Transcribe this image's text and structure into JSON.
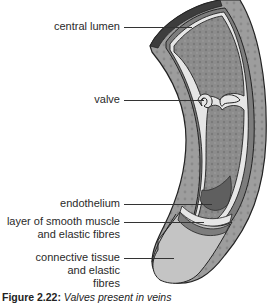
{
  "figure": {
    "labels": [
      {
        "id": "central-lumen",
        "text": "central lumen"
      },
      {
        "id": "valve",
        "text": "valve"
      },
      {
        "id": "endothelium",
        "text": "endothelium"
      },
      {
        "id": "smooth-muscle",
        "line1": "layer of smooth muscle",
        "line2": "and elastic fibres"
      },
      {
        "id": "connective-tissue",
        "line1": "connective tissue",
        "line2": "and elastic",
        "line3": "fibres"
      }
    ],
    "caption": {
      "number": "Figure 2.22:",
      "text": "Valves present in veins"
    },
    "colors": {
      "outer_wall": "#a9a9a9",
      "outer_wall_dark": "#4a4a4a",
      "muscle_layer": "#7d7d7d",
      "endothelium": "#e8e8e8",
      "lumen": "#8f8f8f",
      "connective_face": "#c4c4c4",
      "leader_lines": "#333333"
    }
  }
}
